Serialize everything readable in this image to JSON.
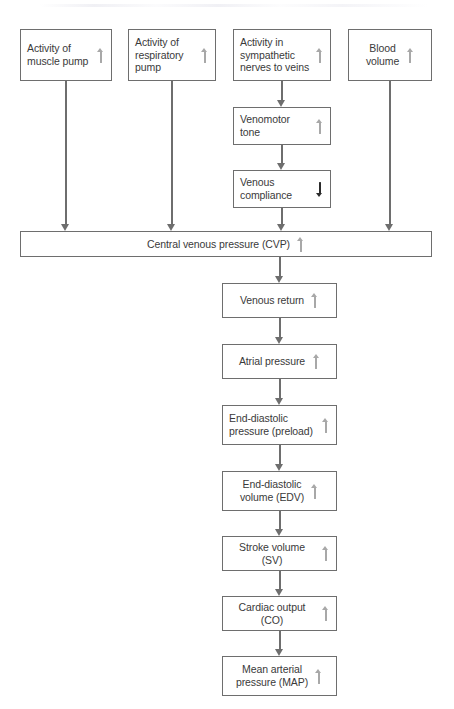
{
  "diagram": {
    "colors": {
      "box_border": "#6e6e6e",
      "text": "#3a3a3a",
      "connector": "#6e6e6e",
      "increase_arrow": "#a8a8a8",
      "decrease_arrow": "#2b2b2b",
      "background": "#ffffff"
    },
    "top_row": [
      {
        "id": "muscle-pump",
        "label": "Activity of\nmuscle pump",
        "trend": "increase"
      },
      {
        "id": "respiratory-pump",
        "label": "Activity of\nrespiratory\npump",
        "trend": "increase"
      },
      {
        "id": "sympathetic",
        "label": "Activity in\nsympathetic\nnerves to veins",
        "trend": "increase"
      },
      {
        "id": "blood-volume",
        "label": "Blood\nvolume",
        "trend": "increase"
      }
    ],
    "sympathetic_branch": [
      {
        "id": "venomotor-tone",
        "label": "Venomotor\ntone",
        "trend": "increase"
      },
      {
        "id": "venous-compliance",
        "label": "Venous\ncompliance",
        "trend": "decrease"
      }
    ],
    "banner": {
      "id": "cvp",
      "label": "Central venous pressure (CVP)",
      "trend": "increase"
    },
    "chain": [
      {
        "id": "venous-return",
        "label": "Venous return",
        "trend": "increase"
      },
      {
        "id": "atrial-pressure",
        "label": "Atrial pressure",
        "trend": "increase"
      },
      {
        "id": "edp-preload",
        "label": "End-diastolic\npressure (preload)",
        "trend": "increase"
      },
      {
        "id": "edv",
        "label": "End-diastolic\nvolume (EDV)",
        "trend": "increase"
      },
      {
        "id": "stroke-volume",
        "label": "Stroke volume (SV)",
        "trend": "increase"
      },
      {
        "id": "cardiac-output",
        "label": "Cardiac output (CO)",
        "trend": "increase"
      },
      {
        "id": "map",
        "label": "Mean arterial\npressure (MAP)",
        "trend": "increase"
      }
    ]
  }
}
